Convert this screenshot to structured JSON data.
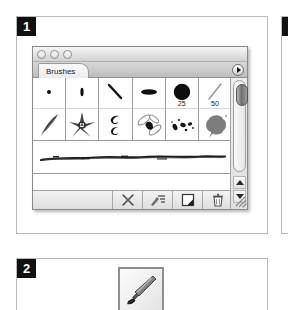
{
  "figure": {
    "panels": [
      {
        "badge": "1",
        "name": "brushes-palette-figure"
      },
      {
        "badge": "2",
        "name": "brush-tool-figure"
      },
      {
        "badge": "",
        "name": "adjacent-figure-sliver"
      }
    ]
  },
  "window": {
    "title_bar": {
      "buttons": [
        {
          "name": "close-button",
          "label": ""
        },
        {
          "name": "minimize-button",
          "label": ""
        },
        {
          "name": "zoom-button",
          "label": ""
        }
      ]
    },
    "tabs": [
      {
        "label": "Brushes",
        "active": true
      }
    ],
    "palette_menu": {
      "label": "",
      "icon": "triangle-right-icon"
    }
  },
  "brush_grid": {
    "rows": [
      [
        {
          "name": "brush-hard-round-1",
          "shape": "dot-small",
          "size": ""
        },
        {
          "name": "brush-hard-round-3",
          "shape": "dot-tall",
          "size": ""
        },
        {
          "name": "brush-slash-stroke",
          "shape": "diagonal-short",
          "size": ""
        },
        {
          "name": "brush-flat-oval",
          "shape": "ellipse",
          "size": ""
        },
        {
          "name": "brush-soft-round-25",
          "shape": "circle-large",
          "size": "25"
        },
        {
          "name": "brush-diagonal-50",
          "shape": "diagonal-soft",
          "size": "50"
        }
      ],
      [
        {
          "name": "brush-feather",
          "shape": "feather",
          "size": ""
        },
        {
          "name": "brush-starburst",
          "shape": "starburst",
          "size": ""
        },
        {
          "name": "brush-comma",
          "shape": "comma",
          "size": ""
        },
        {
          "name": "brush-dragonfly",
          "shape": "dragonfly",
          "size": ""
        },
        {
          "name": "brush-spatter-specks",
          "shape": "specks",
          "size": ""
        },
        {
          "name": "brush-splat-blob",
          "shape": "splat",
          "size": ""
        }
      ]
    ]
  },
  "stroke_preview": {
    "name": "brush-stroke-preview",
    "description": ""
  },
  "toolbar": {
    "buttons": [
      {
        "name": "clear-brush-button",
        "icon": "x-icon",
        "label": ""
      },
      {
        "name": "brush-options-button",
        "icon": "brush-sliders-icon",
        "label": ""
      },
      {
        "name": "new-brush-button",
        "icon": "new-document-icon",
        "label": ""
      },
      {
        "name": "delete-brush-button",
        "icon": "trash-icon",
        "label": ""
      }
    ],
    "resize_grip": {
      "name": "resize-grip",
      "icon": "resize-grip-icon"
    }
  },
  "scrollbar": {
    "name": "vertical-scrollbar",
    "up_arrow": "scroll-up-arrow-icon",
    "down_arrow": "scroll-down-arrow-icon",
    "thumb": "scroll-thumb"
  },
  "brush_tool": {
    "name": "brush-tool-icon",
    "label": ""
  },
  "colors": {
    "badge_bg": "#111111",
    "badge_fg": "#ffffff",
    "panel_border": "#b9b9b9",
    "window_border": "#8a8a8a",
    "ink": "#1a1a1a"
  }
}
